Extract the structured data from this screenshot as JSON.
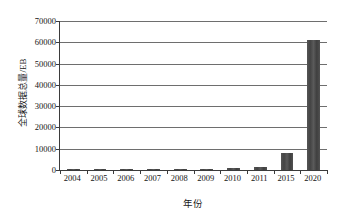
{
  "chart_data": {
    "type": "bar",
    "title": "",
    "xlabel": "年份",
    "ylabel": "全球数据总量/EB",
    "categories": [
      "2004",
      "2005",
      "2006",
      "2007",
      "2008",
      "2009",
      "2010",
      "2011",
      "2015",
      "2020"
    ],
    "values": [
      60,
      120,
      180,
      280,
      480,
      620,
      900,
      1300,
      8000,
      61000
    ],
    "ylim": [
      0,
      70000
    ],
    "ytick_labels": [
      "0",
      "10000",
      "20000",
      "30000",
      "40000",
      "50000",
      "60000",
      "70000"
    ],
    "ytick_values": [
      0,
      10000,
      20000,
      30000,
      40000,
      50000,
      60000,
      70000
    ],
    "grid": true,
    "legend": "none",
    "series_color": "#4d4d4d",
    "axis_color": "#3b3b3b",
    "gridline_color": "#6e6e6e"
  }
}
